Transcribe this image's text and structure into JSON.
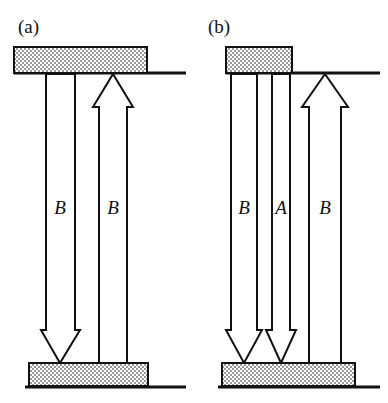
{
  "figure": {
    "type": "schematic-diagram",
    "width": 388,
    "height": 403,
    "background_color": "#ffffff",
    "line_color": "#111111",
    "block_fill_color": "#d9d9d9",
    "block_pattern": "stipple-checker",
    "panels": [
      {
        "id": "a",
        "label": "(a)",
        "top_block": {
          "name": "top-phase-block",
          "x": 14,
          "y": 47,
          "w": 133,
          "h": 26
        },
        "bottom_block": {
          "name": "bottom-phase-block",
          "x": 29,
          "y": 363,
          "w": 119,
          "h": 23
        },
        "top_baseline": {
          "x1": 14,
          "x2": 186,
          "y": 73
        },
        "bottom_baseline": {
          "x1": 25,
          "x2": 186,
          "y": 387
        },
        "arrows": [
          {
            "name": "flux-arrow-down-b",
            "label": "B",
            "direction": "down",
            "shaft_left": 46,
            "shaft_right": 75,
            "head_left": 41,
            "head_right": 80,
            "tip": 60,
            "label_x": 60,
            "label_y": 214
          },
          {
            "name": "flux-arrow-up-b",
            "label": "B",
            "direction": "up",
            "shaft_left": 99,
            "shaft_right": 127,
            "head_left": 93,
            "head_right": 133,
            "tip": 113,
            "label_x": 113,
            "label_y": 214
          }
        ]
      },
      {
        "id": "b",
        "label": "(b)",
        "top_block": {
          "name": "top-phase-block",
          "x": 226,
          "y": 47,
          "w": 66,
          "h": 26
        },
        "bottom_block": {
          "name": "bottom-phase-block",
          "x": 222,
          "y": 363,
          "w": 133,
          "h": 23
        },
        "top_baseline": {
          "x1": 226,
          "x2": 380,
          "y": 73
        },
        "bottom_baseline": {
          "x1": 218,
          "x2": 380,
          "y": 387
        },
        "arrows": [
          {
            "name": "flux-arrow-down-b-left",
            "label": "B",
            "direction": "down",
            "shaft_left": 231,
            "shaft_right": 257,
            "head_left": 226,
            "head_right": 262,
            "tip": 244,
            "label_x": 244,
            "label_y": 214
          },
          {
            "name": "flux-arrow-down-a",
            "label": "A",
            "direction": "down",
            "shaft_left": 272,
            "shaft_right": 290,
            "head_left": 266,
            "head_right": 296,
            "tip": 281,
            "label_x": 281,
            "label_y": 214
          },
          {
            "name": "flux-arrow-up-b-right",
            "label": "B",
            "direction": "up",
            "shaft_left": 309,
            "shaft_right": 341,
            "head_left": 302,
            "head_right": 348,
            "tip": 325,
            "label_x": 325,
            "label_y": 214
          }
        ]
      }
    ],
    "geometry": {
      "arrow_top_y": 74,
      "arrow_bottom_y": 363,
      "head_height": 33,
      "up_head_base_y": 107,
      "down_head_base_y": 330
    }
  }
}
